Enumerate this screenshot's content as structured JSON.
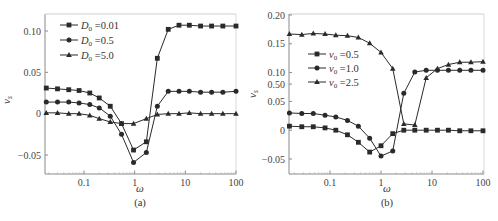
{
  "figure": {
    "background": "#ffffff",
    "line_color": "#2a2a2a",
    "axis_color": "#8a8a8a"
  },
  "chart_data": [
    {
      "type": "line",
      "panel_label": "(a)",
      "xlabel": "ω",
      "ylabel": "v_s",
      "xscale": "log",
      "xlim": [
        0.018,
        100
      ],
      "ylim": [
        -0.075,
        0.12
      ],
      "xticks": [
        0.1,
        1,
        10,
        100
      ],
      "xtick_labels": [
        "0.1",
        "1",
        "10",
        "100"
      ],
      "yticks": [
        0.1,
        0.05,
        0,
        -0.05
      ],
      "ytick_labels": [
        "0.10",
        "0.05",
        "0",
        "−0.05"
      ],
      "legend_position": "upper left",
      "x": [
        0.018,
        0.03,
        0.05,
        0.08,
        0.13,
        0.2,
        0.33,
        0.55,
        0.95,
        1.7,
        2.8,
        4.6,
        7.5,
        12,
        20,
        33,
        55,
        100
      ],
      "series": [
        {
          "name": "D0=0.01",
          "legend_main": "D",
          "legend_sub": "0",
          "legend_value": "=0.01",
          "marker": "square",
          "values": [
            0.031,
            0.03,
            0.029,
            0.028,
            0.025,
            0.019,
            0.009,
            -0.012,
            -0.044,
            -0.034,
            0.067,
            0.102,
            0.107,
            0.107,
            0.106,
            0.106,
            0.106,
            0.106
          ]
        },
        {
          "name": "D0=0.5",
          "legend_main": "D",
          "legend_sub": "0",
          "legend_value": "=0.5",
          "marker": "circle",
          "values": [
            0.014,
            0.014,
            0.014,
            0.013,
            0.011,
            0.007,
            -0.003,
            -0.025,
            -0.059,
            -0.047,
            0.009,
            0.027,
            0.027,
            0.027,
            0.026,
            0.026,
            0.026,
            0.027
          ]
        },
        {
          "name": "D0=5.0",
          "legend_main": "D",
          "legend_sub": "0",
          "legend_value": "=5.0",
          "marker": "triangle",
          "values": [
            0.001,
            0.001,
            0.0,
            0.0,
            -0.002,
            -0.006,
            -0.01,
            -0.012,
            -0.012,
            -0.006,
            -0.001,
            0.0,
            0.0,
            0.001,
            0.0,
            0.0,
            0.0,
            0.0
          ]
        }
      ]
    },
    {
      "type": "line",
      "panel_label": "(b)",
      "xlabel": "ω",
      "ylabel": "v_s",
      "xscale": "log",
      "xlim": [
        0.016,
        100
      ],
      "ylim": [
        -0.075,
        0.2
      ],
      "xticks": [
        0.1,
        1,
        10,
        100
      ],
      "xtick_labels": [
        "0.1",
        "1",
        "10",
        "100"
      ],
      "yticks": [
        0.2,
        0.15,
        0.1,
        0.05,
        0,
        -0.05
      ],
      "ytick_labels": [
        "0.20",
        "0.15",
        "0.10",
        "0.05",
        "0",
        "−0.05"
      ],
      "extra_ytick": {
        "label": "0.50",
        "value": 0.08
      },
      "legend_position": "center left",
      "x": [
        0.016,
        0.028,
        0.047,
        0.08,
        0.13,
        0.22,
        0.36,
        0.6,
        1.0,
        1.7,
        2.8,
        4.6,
        7.7,
        12.8,
        21,
        35,
        58,
        100
      ],
      "series": [
        {
          "name": "v0=0.5",
          "legend_main": "v",
          "legend_sub": "0",
          "legend_value": "=0.5",
          "marker": "square",
          "values": [
            0.007,
            0.006,
            0.006,
            0.004,
            0.0,
            -0.008,
            -0.021,
            -0.038,
            -0.027,
            -0.006,
            0.0,
            0.0,
            0.0,
            0.0,
            0.0,
            -0.001,
            -0.001,
            -0.001
          ]
        },
        {
          "name": "v0=1.0",
          "legend_main": "v",
          "legend_sub": "0",
          "legend_value": "=1.0",
          "marker": "circle",
          "values": [
            0.03,
            0.029,
            0.029,
            0.026,
            0.023,
            0.017,
            0.007,
            -0.014,
            -0.045,
            -0.036,
            0.064,
            0.101,
            0.104,
            0.104,
            0.104,
            0.104,
            0.104,
            0.104
          ]
        },
        {
          "name": "v0=2.5",
          "legend_main": "v",
          "legend_sub": "0",
          "legend_value": "=2.5",
          "marker": "triangle",
          "values": [
            0.167,
            0.166,
            0.168,
            0.167,
            0.165,
            0.164,
            0.161,
            0.151,
            0.135,
            0.107,
            0.011,
            0.009,
            0.091,
            0.107,
            0.114,
            0.118,
            0.118,
            0.119
          ]
        }
      ]
    }
  ],
  "panels_layout": [
    {
      "plot": {
        "left": 45,
        "right": 236,
        "top": 14,
        "bottom": 174
      },
      "y_map": {
        "v1": 0.1,
        "p1": 31,
        "v2": -0.05,
        "p2": 155
      },
      "x_map": {
        "v1": 0.1,
        "p1": 84,
        "v2": 100,
        "p2": 236
      },
      "legend": {
        "x": 60,
        "y": 25,
        "dy": 15
      },
      "ylabel_pos": {
        "x": 10,
        "y": 100
      },
      "xlabel_pos": {
        "x": 140,
        "y": 192
      },
      "panel_label_pos": {
        "x": 140,
        "y": 206
      }
    },
    {
      "plot": {
        "left": 289,
        "right": 484,
        "top": 14,
        "bottom": 174
      },
      "y_map": {
        "v1": 0.2,
        "p1": 15,
        "v2": -0.05,
        "p2": 159
      },
      "x_map": {
        "v1": 0.1,
        "p1": 330,
        "v2": 100,
        "p2": 483
      },
      "legend": {
        "x": 308,
        "y": 54,
        "dy": 14
      },
      "ylabel_pos": {
        "x": 256,
        "y": 94
      },
      "xlabel_pos": {
        "x": 387,
        "y": 192
      },
      "panel_label_pos": {
        "x": 387,
        "y": 206
      }
    }
  ]
}
